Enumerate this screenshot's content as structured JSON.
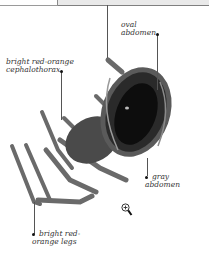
{
  "header": {
    "tabs": [
      {
        "state": "inactive"
      },
      {
        "state": "active"
      }
    ]
  },
  "illustration": {
    "subject": "spider",
    "labels": [
      {
        "id": "oval-abdomen",
        "line1": "oval",
        "line2": "abdomen"
      },
      {
        "id": "cephalothorax",
        "line1": "bright red-orange",
        "line2": "cephalothorax"
      },
      {
        "id": "gray-abdomen",
        "line1": "gray",
        "line2": "abdomen"
      },
      {
        "id": "legs",
        "line1": "bright red-",
        "line2": "orange legs"
      }
    ]
  },
  "controls": {
    "zoom_icon": "magnifier-plus-icon"
  }
}
